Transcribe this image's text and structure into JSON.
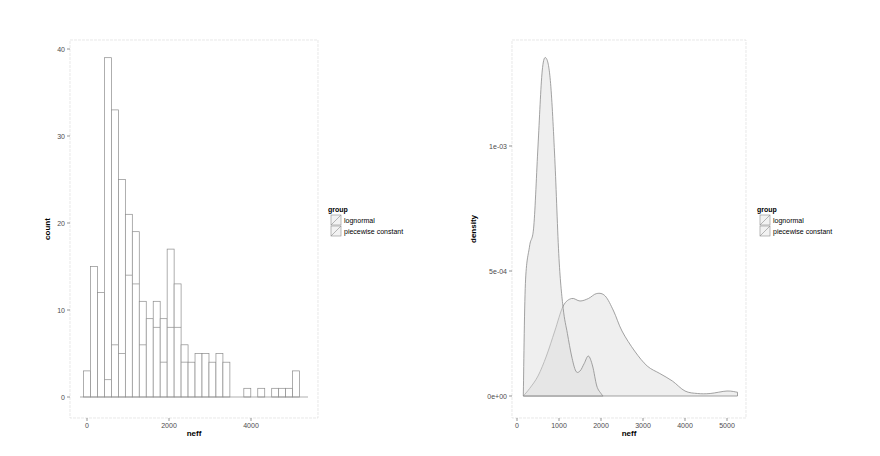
{
  "chart_data": [
    {
      "type": "bar",
      "subtype": "stacked histogram",
      "xlabel": "neff",
      "ylabel": "count",
      "xticks": [
        "0",
        "2000",
        "4000"
      ],
      "yticks": [
        "0",
        "10",
        "20",
        "30",
        "40"
      ],
      "ylim": [
        0,
        41
      ],
      "xlim": [
        -200,
        5400
      ],
      "grid": false,
      "legend": {
        "title": "group",
        "position": "right",
        "entries": [
          "lognormal",
          "piecewise constant"
        ]
      },
      "bin_width": 170,
      "bins": [
        {
          "x": 0,
          "total": 3,
          "split": 0
        },
        {
          "x": 170,
          "total": 15,
          "split": 0
        },
        {
          "x": 340,
          "total": 12,
          "split": 0
        },
        {
          "x": 510,
          "total": 39,
          "split": 2
        },
        {
          "x": 680,
          "total": 33,
          "split": 6
        },
        {
          "x": 850,
          "total": 25,
          "split": 5
        },
        {
          "x": 1020,
          "total": 21,
          "split": 14
        },
        {
          "x": 1190,
          "total": 19,
          "split": 13
        },
        {
          "x": 1360,
          "total": 11,
          "split": 6
        },
        {
          "x": 1530,
          "total": 9,
          "split": 9
        },
        {
          "x": 1700,
          "total": 11,
          "split": 8
        },
        {
          "x": 1870,
          "total": 9,
          "split": 4
        },
        {
          "x": 2040,
          "total": 17,
          "split": 8
        },
        {
          "x": 2210,
          "total": 13,
          "split": 8
        },
        {
          "x": 2380,
          "total": 6,
          "split": 4
        },
        {
          "x": 2550,
          "total": 4,
          "split": 4
        },
        {
          "x": 2720,
          "total": 5,
          "split": 5
        },
        {
          "x": 2890,
          "total": 5,
          "split": 5
        },
        {
          "x": 3060,
          "total": 4,
          "split": 4
        },
        {
          "x": 3230,
          "total": 5,
          "split": 5
        },
        {
          "x": 3400,
          "total": 4,
          "split": 4
        },
        {
          "x": 3570,
          "total": 0,
          "split": 0
        },
        {
          "x": 3740,
          "total": 0,
          "split": 0
        },
        {
          "x": 3910,
          "total": 1,
          "split": 1
        },
        {
          "x": 4080,
          "total": 0,
          "split": 0
        },
        {
          "x": 4250,
          "total": 1,
          "split": 1
        },
        {
          "x": 4420,
          "total": 0,
          "split": 0
        },
        {
          "x": 4590,
          "total": 1,
          "split": 1
        },
        {
          "x": 4760,
          "total": 1,
          "split": 1
        },
        {
          "x": 4930,
          "total": 1,
          "split": 1
        },
        {
          "x": 5100,
          "total": 3,
          "split": 3
        }
      ]
    },
    {
      "type": "area",
      "subtype": "density",
      "xlabel": "neff",
      "ylabel": "density",
      "xticks": [
        "0",
        "1000",
        "2000",
        "3000",
        "4000",
        "5000"
      ],
      "yticks": [
        "0e+00",
        "5e-04",
        "1e-03"
      ],
      "ylim": [
        0,
        0.0014
      ],
      "xlim": [
        -100,
        5300
      ],
      "grid": false,
      "legend": {
        "title": "group",
        "position": "right",
        "entries": [
          "lognormal",
          "piecewise constant"
        ]
      },
      "series": [
        {
          "name": "lognormal",
          "x": [
            150,
            200,
            300,
            400,
            500,
            600,
            700,
            800,
            900,
            1000,
            1100,
            1200,
            1300,
            1400,
            1500,
            1600,
            1700,
            1800,
            1900,
            2000,
            2050
          ],
          "y": [
            0.0,
            0.00045,
            0.0006,
            0.00068,
            0.001,
            0.0013,
            0.00135,
            0.00125,
            0.00095,
            0.00055,
            0.00035,
            0.00025,
            0.00016,
            0.0001,
            0.0001,
            0.00013,
            0.00016,
            0.00012,
            4e-05,
            1e-05,
            0.0
          ]
        },
        {
          "name": "piecewise constant",
          "x": [
            150,
            300,
            500,
            700,
            900,
            1100,
            1300,
            1500,
            1700,
            1900,
            2100,
            2300,
            2500,
            2800,
            3100,
            3400,
            3700,
            4000,
            4300,
            4600,
            5000,
            5250
          ],
          "y": [
            0.0,
            3e-05,
            8e-05,
            0.00016,
            0.00026,
            0.00036,
            0.00039,
            0.00038,
            0.00039,
            0.00041,
            0.0004,
            0.00034,
            0.00026,
            0.00018,
            0.00012,
            9e-05,
            6e-05,
            2e-05,
            1e-05,
            1e-05,
            2e-05,
            1.5e-05
          ]
        }
      ]
    }
  ],
  "left_chart": {
    "xlabel": "neff",
    "ylabel": "count",
    "xticks": [
      "0",
      "2000",
      "4000"
    ],
    "yticks": [
      "0",
      "10",
      "20",
      "30",
      "40"
    ],
    "legend": {
      "title": "group",
      "items": [
        "lognormal",
        "piecewise constant"
      ]
    }
  },
  "right_chart": {
    "xlabel": "neff",
    "ylabel": "density",
    "xticks": [
      "0",
      "1000",
      "2000",
      "3000",
      "4000",
      "5000"
    ],
    "yticks": [
      "0e+00",
      "5e-04",
      "1e-03"
    ],
    "legend": {
      "title": "group",
      "items": [
        "lognormal",
        "piecewise constant"
      ]
    }
  },
  "colors": {
    "outline": "#8c8c8c",
    "fill": "#f2f2f2",
    "panel_border": "#cccccc",
    "tick_text": "#4d4d4d"
  }
}
